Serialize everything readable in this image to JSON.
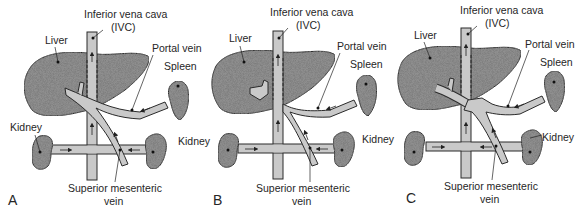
{
  "figure": {
    "type": "anatomical-diagram",
    "colors": {
      "organ_fill": "#8f8f8f",
      "vessel_fill": "#c9c9c9",
      "outline": "#2a2a2a",
      "text": "#262626",
      "background": "#ffffff"
    }
  },
  "panels": [
    {
      "id": "A",
      "panel_label": "A",
      "labels": {
        "ivc": "Inferior vena cava",
        "ivc_abbr": "(IVC)",
        "liver": "Liver",
        "portal_vein": "Portal vein",
        "spleen": "Spleen",
        "kidney_left": "Kidney",
        "kidney_right": "Kidney",
        "smv_line1": "Superior mesenteric",
        "smv_line2": "vein"
      }
    },
    {
      "id": "B",
      "panel_label": "B",
      "labels": {
        "ivc": "Inferior vena cava",
        "ivc_abbr": "(IVC)",
        "liver": "Liver",
        "portal_vein": "Portal vein",
        "spleen": "Spleen",
        "kidney_left": "Kidney",
        "kidney_right": "Kidney",
        "smv_line1": "Superior mesenteric",
        "smv_line2": "vein"
      }
    },
    {
      "id": "C",
      "panel_label": "C",
      "labels": {
        "ivc": "Inferior vena cava",
        "ivc_abbr": "(IVC)",
        "liver": "Liver",
        "portal_vein": "Portal vein",
        "spleen": "Spleen",
        "kidney_left": "Kidney",
        "kidney_right": "Kidney",
        "smv_line1": "Superior mesenteric",
        "smv_line2": "vein"
      }
    }
  ]
}
